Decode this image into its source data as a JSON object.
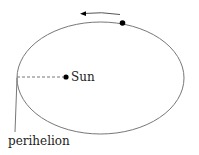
{
  "diagram": {
    "labels": {
      "sun": "Sun",
      "perihelion": "perihelion"
    },
    "elements": {
      "orbit": {
        "shape": "ellipse",
        "cx": 100.5,
        "cy": 78,
        "rx": 83.5,
        "ry": 56
      },
      "sun_dot": {
        "x": 66,
        "y": 77
      },
      "planet_dot": {
        "x": 122,
        "y": 23
      },
      "direction_arrow": {
        "direction": "counterclockwise",
        "from": [
          120,
          14
        ],
        "to": [
          82,
          14
        ]
      },
      "perihelion_line": {
        "style": "dashed",
        "from": [
          17,
          77
        ],
        "to": [
          63,
          77
        ]
      }
    },
    "colors": {
      "line": "#777777",
      "dot": "#000000",
      "text": "#222222"
    }
  }
}
